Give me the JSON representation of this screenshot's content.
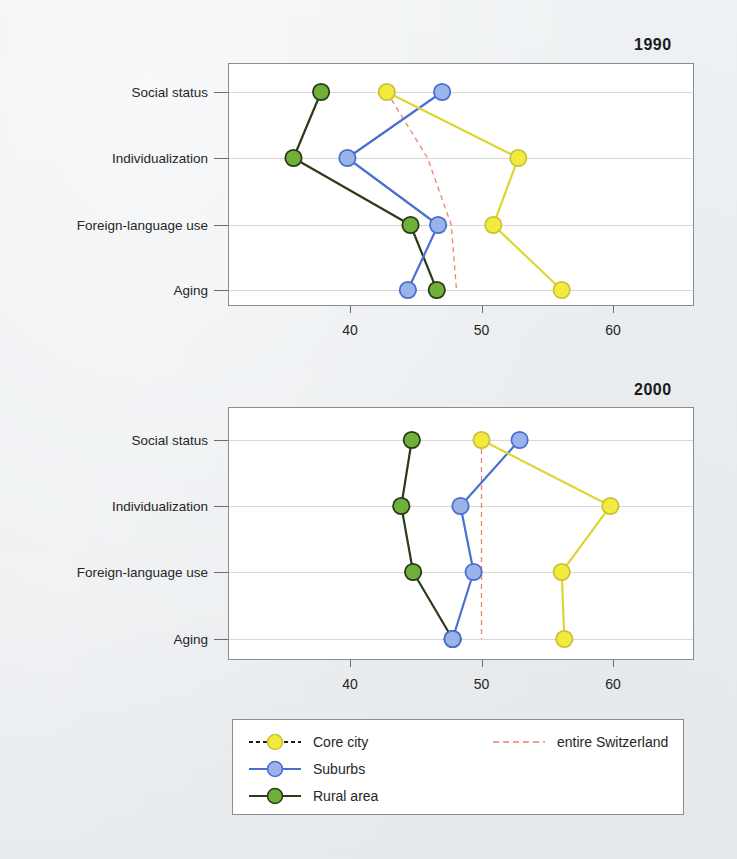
{
  "figure": {
    "panels": [
      {
        "title": "1990"
      },
      {
        "title": "2000"
      }
    ],
    "categories": [
      "Social status",
      "Individualization",
      "Foreign-language use",
      "Aging"
    ],
    "xticks": [
      "40",
      "50",
      "60"
    ]
  },
  "legend": {
    "items": [
      {
        "label": "Core city",
        "color": "#f2eb3d",
        "line": "#1c1c1c",
        "style": "dashed"
      },
      {
        "label": "Suburbs",
        "color": "#9ab3e8",
        "line": "#4a6fd0",
        "style": "solid"
      },
      {
        "label": "Rural area",
        "color": "#6fb03a",
        "line": "#2b3a17",
        "style": "solid"
      },
      {
        "label": "entire Switzerland",
        "color": "#f0826a",
        "line": "#f0826a",
        "style": "dashed"
      }
    ]
  },
  "chart_data": [
    {
      "type": "line",
      "title": "1990",
      "xlabel": "",
      "ylabel": "",
      "xlim": [
        33,
        64
      ],
      "ylim": [
        0,
        3
      ],
      "grid": true,
      "orientation": "horizontal",
      "categories": [
        "Social status",
        "Individualization",
        "Foreign-language use",
        "Aging"
      ],
      "xticks": [
        40,
        50,
        60
      ],
      "series": [
        {
          "name": "Core city",
          "color": "#f2eb3d",
          "values": [
            42.8,
            52.8,
            50.9,
            56.1
          ]
        },
        {
          "name": "Suburbs",
          "color": "#9ab3e8",
          "values": [
            47.0,
            39.8,
            46.7,
            44.4
          ]
        },
        {
          "name": "Rural area",
          "color": "#6fb03a",
          "values": [
            37.8,
            35.7,
            44.6,
            46.6
          ]
        },
        {
          "name": "entire Switzerland",
          "color": "#f0826a",
          "values": [
            42.8,
            45.9,
            47.7,
            48.1
          ]
        }
      ]
    },
    {
      "type": "line",
      "title": "2000",
      "xlabel": "",
      "ylabel": "",
      "xlim": [
        33,
        64
      ],
      "ylim": [
        0,
        3
      ],
      "grid": true,
      "orientation": "horizontal",
      "categories": [
        "Social status",
        "Individualization",
        "Foreign-language use",
        "Aging"
      ],
      "xticks": [
        40,
        50,
        60
      ],
      "series": [
        {
          "name": "Core city",
          "color": "#f2eb3d",
          "values": [
            50.0,
            59.8,
            56.1,
            56.3
          ]
        },
        {
          "name": "Suburbs",
          "color": "#9ab3e8",
          "values": [
            52.9,
            48.4,
            49.4,
            47.8
          ]
        },
        {
          "name": "Rural area",
          "color": "#6fb03a",
          "values": [
            44.7,
            43.9,
            44.8,
            47.8
          ]
        },
        {
          "name": "entire Switzerland",
          "color": "#f0826a",
          "values": [
            50.0,
            50.0,
            50.0,
            50.0
          ]
        }
      ]
    }
  ]
}
